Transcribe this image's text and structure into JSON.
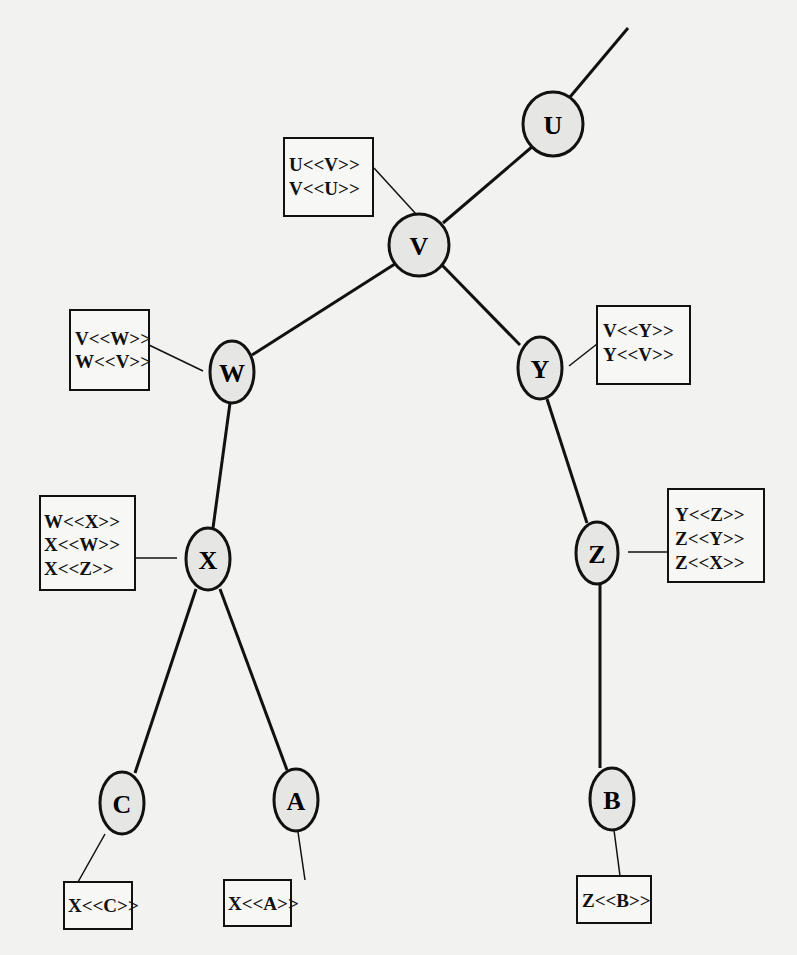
{
  "diagram": {
    "type": "tree",
    "node_fill": "#e6e6e4",
    "stroke": "#111111",
    "nodes": [
      {
        "id": "U",
        "label": "U",
        "cx": 553,
        "cy": 124
      },
      {
        "id": "V",
        "label": "V",
        "cx": 419,
        "cy": 245
      },
      {
        "id": "W",
        "label": "W",
        "cx": 232,
        "cy": 372
      },
      {
        "id": "Y",
        "label": "Y",
        "cx": 540,
        "cy": 368
      },
      {
        "id": "X",
        "label": "X",
        "cx": 208,
        "cy": 559
      },
      {
        "id": "Z",
        "label": "Z",
        "cx": 597,
        "cy": 553
      },
      {
        "id": "C",
        "label": "C",
        "cx": 122,
        "cy": 803
      },
      {
        "id": "A",
        "label": "A",
        "cx": 296,
        "cy": 800
      },
      {
        "id": "B",
        "label": "B",
        "cx": 612,
        "cy": 799
      }
    ],
    "edges": [
      {
        "from": "U",
        "to": "parent-offpage"
      },
      {
        "from": "U",
        "to": "V"
      },
      {
        "from": "V",
        "to": "W"
      },
      {
        "from": "V",
        "to": "Y"
      },
      {
        "from": "W",
        "to": "X"
      },
      {
        "from": "Y",
        "to": "Z"
      },
      {
        "from": "X",
        "to": "C"
      },
      {
        "from": "X",
        "to": "A"
      },
      {
        "from": "Z",
        "to": "B"
      }
    ],
    "annotation_boxes": [
      {
        "attached_to": "V",
        "lines": [
          "U<<V>>",
          "V<<U>>"
        ]
      },
      {
        "attached_to": "W",
        "lines": [
          "V<<W>>",
          "W<<V>>"
        ]
      },
      {
        "attached_to": "Y",
        "lines": [
          "V<<Y>>",
          "Y<<V>>"
        ]
      },
      {
        "attached_to": "X",
        "lines": [
          "W<<X>>",
          "X<<W>>",
          "X<<Z>>"
        ]
      },
      {
        "attached_to": "Z",
        "lines": [
          "Y<<Z>>",
          "Z<<Y>>",
          "Z<<X>>"
        ]
      },
      {
        "attached_to": "C",
        "lines": [
          "X<<C>>"
        ]
      },
      {
        "attached_to": "A",
        "lines": [
          "X<<A>>"
        ]
      },
      {
        "attached_to": "B",
        "lines": [
          "Z<<B>>"
        ]
      }
    ]
  }
}
